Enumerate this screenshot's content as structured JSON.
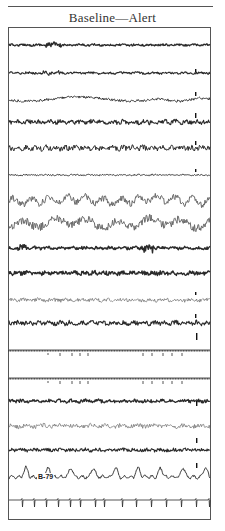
{
  "figure": {
    "title": "Baseline—Alert",
    "frame": {
      "left": 8,
      "top": 27,
      "right": 211,
      "bottom": 520
    },
    "ink_color": "#2a2a2a",
    "light_ink_color": "#6a6a6a"
  },
  "annotations": [
    {
      "text": "B-79",
      "x": 37,
      "y": 473
    }
  ],
  "calibration_marks": [
    {
      "channel": 1,
      "x": 195,
      "y": 72,
      "height": 3
    },
    {
      "channel": 2,
      "x": 195,
      "y": 96,
      "height": 4
    },
    {
      "channel": 3,
      "x": 195,
      "y": 118,
      "height": 5
    },
    {
      "channel": 4,
      "x": 195,
      "y": 145,
      "height": 4
    },
    {
      "channel": 5,
      "x": 195,
      "y": 172,
      "height": 3
    },
    {
      "channel": 10,
      "x": 195,
      "y": 295,
      "height": 3
    },
    {
      "channel": 11,
      "x": 195,
      "y": 318,
      "height": 4
    },
    {
      "channel": 12,
      "x": 196,
      "y": 340,
      "height": 7
    },
    {
      "channel": 14,
      "x": 196,
      "y": 406,
      "height": 5
    },
    {
      "channel": 16,
      "x": 196,
      "y": 443,
      "height": 5
    },
    {
      "channel": 17,
      "x": 196,
      "y": 468,
      "height": 5
    }
  ],
  "channels": [
    {
      "id": 0,
      "baseline": 45,
      "type": "eeg",
      "amp": 1.2,
      "freq": 0.9,
      "weight": 1.3,
      "bursts": [
        [
          45,
          62,
          3.5
        ]
      ]
    },
    {
      "id": 1,
      "baseline": 73,
      "type": "eeg",
      "amp": 1.3,
      "freq": 0.8,
      "weight": 1.1,
      "bursts": [
        [
          40,
          60,
          2.5
        ]
      ]
    },
    {
      "id": 2,
      "baseline": 99,
      "type": "slow",
      "amp": 2.5,
      "freq": 0.5,
      "weight": 0.9,
      "drift": 4
    },
    {
      "id": 3,
      "baseline": 122,
      "type": "eeg",
      "amp": 2.6,
      "freq": 1.2,
      "weight": 1.1
    },
    {
      "id": 4,
      "baseline": 148,
      "type": "eeg",
      "amp": 3.2,
      "freq": 1.3,
      "weight": 1.0
    },
    {
      "id": 5,
      "baseline": 175,
      "type": "eeg",
      "amp": 0.9,
      "freq": 0.8,
      "weight": 0.9
    },
    {
      "id": 6,
      "baseline": 200,
      "type": "spiky",
      "amp": 5.0,
      "freq": 1.4,
      "weight": 1.0
    },
    {
      "id": 7,
      "baseline": 223,
      "type": "spiky",
      "amp": 6.0,
      "freq": 0.8,
      "weight": 1.0
    },
    {
      "id": 8,
      "baseline": 248,
      "type": "eeg",
      "amp": 1.8,
      "freq": 1.0,
      "weight": 1.4,
      "bursts": [
        [
          18,
          26,
          4
        ],
        [
          140,
          155,
          5
        ]
      ]
    },
    {
      "id": 9,
      "baseline": 273,
      "type": "eeg",
      "amp": 2.4,
      "freq": 1.3,
      "weight": 1.4
    },
    {
      "id": 10,
      "baseline": 300,
      "type": "thin",
      "amp": 2.2,
      "freq": 0.9,
      "weight": 0.7
    },
    {
      "id": 11,
      "baseline": 323,
      "type": "eeg",
      "amp": 2.6,
      "freq": 1.2,
      "weight": 1.1
    },
    {
      "id": 12,
      "baseline": 350,
      "type": "ticks",
      "amp": 2.5,
      "freq": 1.0,
      "weight": 0.8
    },
    {
      "id": 13,
      "baseline": 378,
      "type": "ticks",
      "amp": 2.5,
      "freq": 1.0,
      "weight": 0.8
    },
    {
      "id": 14,
      "baseline": 401,
      "type": "eeg",
      "amp": 2.0,
      "freq": 1.0,
      "weight": 1.3
    },
    {
      "id": 15,
      "baseline": 426,
      "type": "thin",
      "amp": 2.6,
      "freq": 0.8,
      "weight": 0.7
    },
    {
      "id": 16,
      "baseline": 450,
      "type": "eeg",
      "amp": 2.0,
      "freq": 1.0,
      "weight": 1.1
    },
    {
      "id": 17,
      "baseline": 477,
      "type": "slowwave",
      "amp": 9.0,
      "freq": 0.28,
      "weight": 0.9
    },
    {
      "id": 18,
      "baseline": 500,
      "type": "ecg",
      "amp": 7.0,
      "beats": [
        22,
        34,
        46,
        58,
        70,
        80,
        95,
        104,
        122,
        136,
        151,
        166,
        181,
        196,
        209
      ],
      "weight": 0.8
    }
  ]
}
